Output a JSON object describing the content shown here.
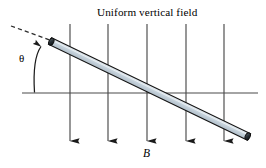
{
  "figure": {
    "title": "Uniform vertical field",
    "angle_label": "θ",
    "field_label": "B",
    "colors": {
      "line": "#3a3a3a",
      "rod_fill": "#c5d2dc",
      "rod_edge": "#1a1a1a",
      "rod_cap": "#3b4750",
      "background": "#ffffff"
    },
    "reference_line": {
      "name": "horizontal-reference-line",
      "x1": 22,
      "y1": 93,
      "x2": 258,
      "y2": 93
    },
    "dashed_line": {
      "name": "dashed-extension-line",
      "x1": 11,
      "y1": 26,
      "x2": 53,
      "y2": 41,
      "dash_pattern": "4,3"
    },
    "rod": {
      "name": "conducting-rod",
      "x1": 50,
      "y1": 41,
      "x2": 249,
      "y2": 137,
      "thickness": 7
    },
    "angle_arc": {
      "name": "theta-angle-arrow",
      "vertex_x": 34,
      "vertex_y": 93,
      "tip_x": 43,
      "tip_y": 43
    },
    "field_arrows": [
      {
        "name": "field-arrow-1",
        "x": 70,
        "y_top": 24,
        "y_tip": 144
      },
      {
        "name": "field-arrow-2",
        "x": 108,
        "y_top": 24,
        "y_tip": 144
      },
      {
        "name": "field-arrow-3",
        "x": 147,
        "y_top": 24,
        "y_tip": 144
      },
      {
        "name": "field-arrow-4",
        "x": 186,
        "y_top": 24,
        "y_tip": 144
      },
      {
        "name": "field-arrow-5",
        "x": 224,
        "y_top": 24,
        "y_tip": 144
      }
    ]
  }
}
